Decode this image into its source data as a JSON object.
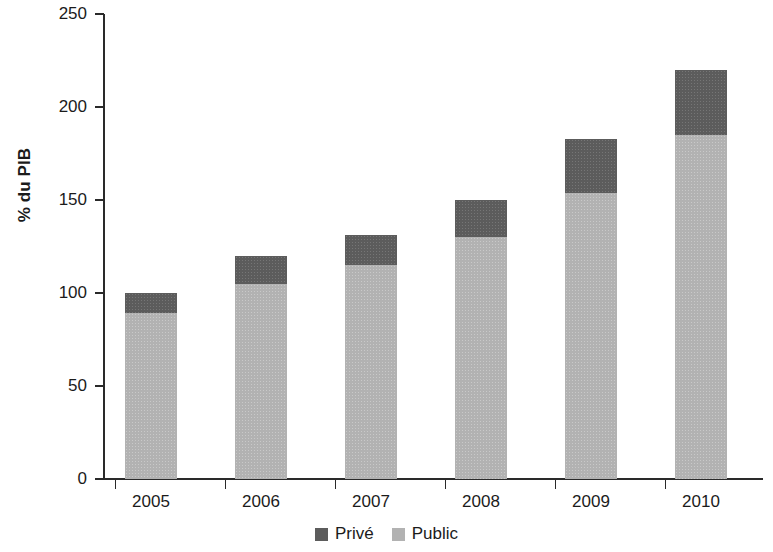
{
  "chart_data": {
    "type": "bar",
    "stacked": true,
    "title": "",
    "subtitle": "",
    "xlabel": "",
    "ylabel": "% du PIB",
    "categories": [
      "2005",
      "2006",
      "2007",
      "2008",
      "2009",
      "2010"
    ],
    "series": [
      {
        "name": "Public",
        "values": [
          89,
          105,
          115,
          130,
          154,
          185
        ],
        "color": "#b2b2b2"
      },
      {
        "name": "Privé",
        "values": [
          11,
          15,
          16,
          20,
          29,
          35
        ],
        "color": "#5c5c5c"
      }
    ],
    "totals": [
      100,
      120,
      131,
      150,
      183,
      220
    ],
    "ylim": [
      0,
      250
    ],
    "yticks": [
      0,
      50,
      100,
      150,
      200,
      250
    ],
    "ytick_labels": [
      "0",
      "50",
      "100",
      "150",
      "200",
      "250"
    ],
    "grid": false,
    "legend": {
      "position": "bottom",
      "entries": [
        {
          "label": "Privé",
          "color": "#5c5c5c"
        },
        {
          "label": "Public",
          "color": "#b2b2b2"
        }
      ]
    },
    "colors": {
      "prive": "#5c5c5c",
      "public": "#b2b2b2",
      "axis": "#2a2a2a",
      "text": "#1b1b1b",
      "background": "#ffffff"
    }
  }
}
